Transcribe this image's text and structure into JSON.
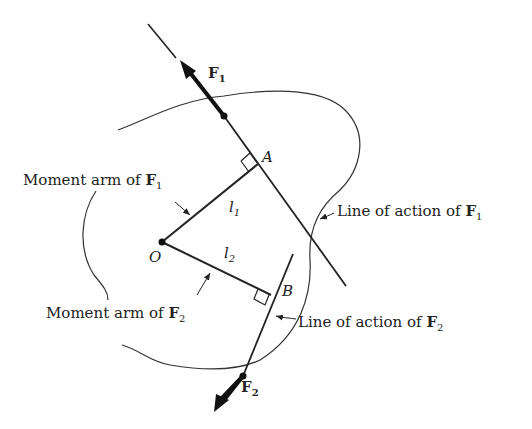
{
  "diagram": {
    "type": "moment-arms-of-forces",
    "points": {
      "origin": "O",
      "foot_1": "A",
      "foot_2": "B"
    },
    "forces": [
      {
        "name": "F",
        "subscript": "1"
      },
      {
        "name": "F",
        "subscript": "2"
      }
    ],
    "arm_lengths": [
      {
        "name": "l",
        "subscript": "1"
      },
      {
        "name": "l",
        "subscript": "2"
      }
    ],
    "labels": {
      "moment_arm_1": {
        "text": "Moment arm of ",
        "force": "F",
        "subscript": "1"
      },
      "moment_arm_2": {
        "text": "Moment arm of ",
        "force": "F",
        "subscript": "2"
      },
      "line_of_action_1": {
        "text": "Line of action of ",
        "force": "F",
        "subscript": "1"
      },
      "line_of_action_2": {
        "text": "Line of action of ",
        "force": "F",
        "subscript": "2"
      }
    },
    "colors": {
      "ink": "#222222",
      "background": "#ffffff"
    }
  }
}
